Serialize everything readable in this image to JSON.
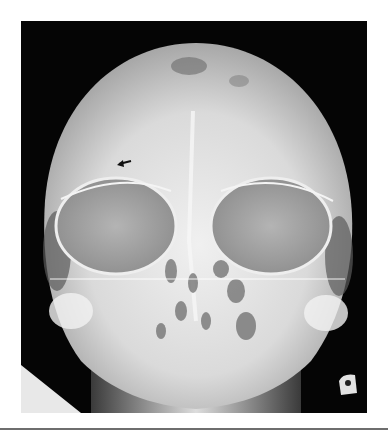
{
  "figure": {
    "marker": "arrow",
    "colors": {
      "background": "#050505",
      "bone": "#e6e6e6",
      "orbit": "#a9a9a9",
      "page": "#ffffff",
      "rule": "#6e6e6e"
    }
  }
}
